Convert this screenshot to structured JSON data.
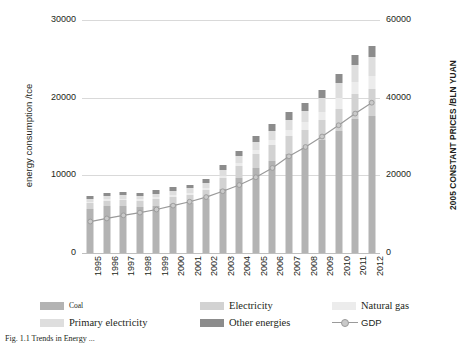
{
  "chart_data": {
    "type": "bar",
    "title": "",
    "subtitle": "",
    "xlabel": "",
    "ylabel": "energy consumption /tce",
    "y2label": "2005 CONSTANT PRICES /BLN YUAN",
    "grid": true,
    "legend_position": "bottom",
    "ylim": [
      0,
      30000
    ],
    "y2lim": [
      0,
      60000
    ],
    "yticks": [
      "0",
      "10000",
      "20000",
      "30000"
    ],
    "y2ticks": [
      "0",
      "20000",
      "40000",
      "60000"
    ],
    "categories": [
      "1995",
      "1996",
      "1997",
      "1998",
      "1999",
      "2000",
      "2001",
      "2002",
      "2003",
      "2004",
      "2005",
      "2006",
      "2007",
      "2008",
      "2009",
      "2010",
      "2011",
      "2012"
    ],
    "stacked": true,
    "series": [
      {
        "name": "Coal",
        "color": "#b3b3b3",
        "values": [
          5700,
          6000,
          6000,
          5900,
          6100,
          6300,
          6500,
          7000,
          8300,
          9600,
          10900,
          11900,
          12800,
          13500,
          14500,
          15700,
          17300,
          17700
        ]
      },
      {
        "name": "Electricity",
        "color": "#d2d2d2",
        "values": [
          700,
          750,
          800,
          820,
          860,
          950,
          1000,
          1100,
          1300,
          1550,
          1800,
          2000,
          2250,
          2400,
          2600,
          2900,
          3200,
          3400
        ]
      },
      {
        "name": "Natural gas",
        "color": "#ececec",
        "values": [
          150,
          160,
          170,
          180,
          200,
          230,
          260,
          300,
          380,
          470,
          560,
          680,
          820,
          950,
          1100,
          1300,
          1500,
          1650
        ]
      },
      {
        "name": "Primary electricity",
        "color": "#dedede",
        "values": [
          400,
          420,
          450,
          470,
          500,
          540,
          580,
          650,
          750,
          880,
          1000,
          1150,
          1300,
          1450,
          1700,
          1950,
          2200,
          2450
        ]
      },
      {
        "name": "Other energies",
        "color": "#8c8c8c",
        "values": [
          350,
          370,
          380,
          400,
          420,
          450,
          480,
          520,
          600,
          680,
          760,
          840,
          930,
          1000,
          1100,
          1200,
          1320,
          1400
        ]
      }
    ],
    "totals": [
      7300,
      7700,
      7800,
      7770,
      8080,
      8470,
      8820,
      9570,
      11330,
      13180,
      15020,
      16570,
      18100,
      19300,
      21000,
      23050,
      25520,
      26600
    ],
    "gdp_series": {
      "name": "GDP",
      "axis": "right",
      "line_color": "#9a9a9a",
      "marker_color": "#c9c9c9",
      "values": [
        8100,
        8900,
        9700,
        10400,
        11200,
        12200,
        13200,
        14400,
        15900,
        17500,
        19500,
        21900,
        24900,
        27300,
        30000,
        32900,
        35900,
        38700
      ]
    }
  },
  "axes": {
    "left_title": "energy consumption /tce",
    "right_title": "2005 CONSTANT PRICES /BLN YUAN"
  },
  "legend": {
    "items": [
      {
        "label": "Coal",
        "key": "coal",
        "type": "swatch"
      },
      {
        "label": "Electricity",
        "key": "elec",
        "type": "swatch"
      },
      {
        "label": "Natural gas",
        "key": "gas",
        "type": "swatch"
      },
      {
        "label": "Primary electricity",
        "key": "prim",
        "type": "swatch"
      },
      {
        "label": "Other energies",
        "key": "other",
        "type": "swatch"
      },
      {
        "label": "GDP",
        "key": "gdp",
        "type": "line-marker"
      }
    ]
  },
  "caption": {
    "text": "Fig. 1.1  Trends in Energy ..."
  }
}
